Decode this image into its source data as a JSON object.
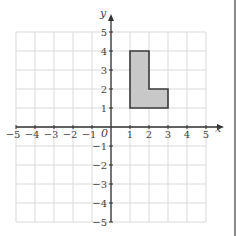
{
  "diagram": {
    "type": "coordinate-grid",
    "x_axis": {
      "label": "x",
      "min": -5,
      "max": 5,
      "ticks": [
        "-5",
        "-4",
        "-3",
        "-2",
        "-1",
        "1",
        "2",
        "3",
        "4",
        "5"
      ]
    },
    "y_axis": {
      "label": "y",
      "min": -5,
      "max": 5,
      "ticks": [
        "5",
        "4",
        "3",
        "2",
        "1",
        "-1",
        "-2",
        "-3",
        "-4",
        "-5"
      ]
    },
    "origin_label": "0",
    "shape": {
      "name": "L-shape",
      "vertices": [
        [
          1,
          1
        ],
        [
          1,
          4
        ],
        [
          2,
          4
        ],
        [
          2,
          2
        ],
        [
          3,
          2
        ],
        [
          3,
          1
        ]
      ],
      "fill": "#c8c8c8",
      "stroke": "#3a3a3a"
    },
    "colors": {
      "grid": "#d9d9d9",
      "axis": "#333333"
    }
  }
}
